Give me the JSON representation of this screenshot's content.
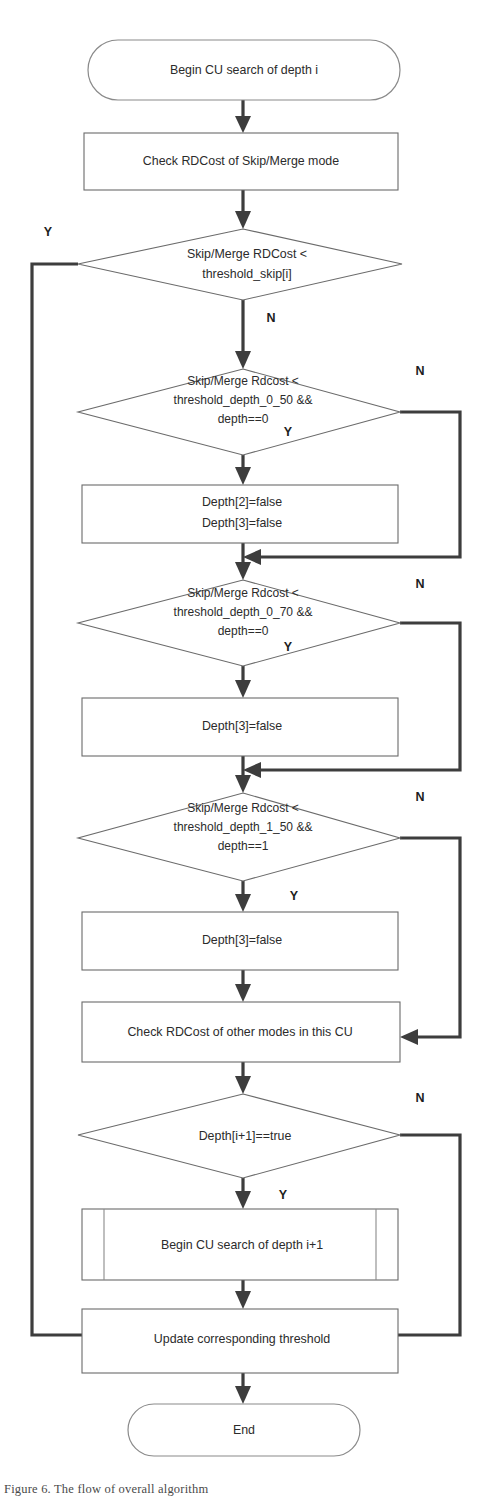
{
  "figure": {
    "caption": "Figure 6.   The flow of overall algorithm"
  },
  "colors": {
    "background": "#ffffff",
    "node_stroke": "#6b6b6b",
    "connector": "#3d3d3d",
    "text": "#2b2b2b"
  },
  "nodes": {
    "start": {
      "id": "start",
      "type": "terminator",
      "label": "Begin CU search of depth i"
    },
    "check_skip_merge": {
      "id": "check_skip_merge",
      "type": "process",
      "label": "Check RDCost of Skip/Merge mode"
    },
    "decision_skip": {
      "id": "decision_skip",
      "type": "decision",
      "line1": "Skip/Merge RDCost  <",
      "line2": "threshold_skip[i]",
      "yes_label": "Y",
      "no_label": "N"
    },
    "decision_d0_50": {
      "id": "decision_d0_50",
      "type": "decision",
      "line1": "Skip/Merge Rdcost <",
      "line2": "threshold_depth_0_50  &&",
      "line3": "depth==0",
      "yes_label": "Y",
      "no_label": "N"
    },
    "set_depth_23_false": {
      "id": "set_depth_23_false",
      "type": "process",
      "line1": "Depth[2]=false",
      "line2": "Depth[3]=false"
    },
    "decision_d0_70": {
      "id": "decision_d0_70",
      "type": "decision",
      "line1": "Skip/Merge Rdcost <",
      "line2": "threshold_depth_0_70  &&",
      "line3": "depth==0",
      "yes_label": "Y",
      "no_label": "N"
    },
    "set_depth3_false_a": {
      "id": "set_depth3_false_a",
      "type": "process",
      "label": "Depth[3]=false"
    },
    "decision_d1_50": {
      "id": "decision_d1_50",
      "type": "decision",
      "line1": "Skip/Merge Rdcost <",
      "line2": "threshold_depth_1_50  &&",
      "line3": "depth==1",
      "yes_label": "Y",
      "no_label": "N"
    },
    "set_depth3_false_b": {
      "id": "set_depth3_false_b",
      "type": "process",
      "label": "Depth[3]=false"
    },
    "check_other_modes": {
      "id": "check_other_modes",
      "type": "process",
      "label": "Check RDCost of other modes in this CU"
    },
    "decision_depth_next": {
      "id": "decision_depth_next",
      "type": "decision",
      "label": "Depth[i+1]==true",
      "yes_label": "Y",
      "no_label": "N"
    },
    "recurse": {
      "id": "recurse",
      "type": "subroutine",
      "label": "Begin  CU search of depth i+1"
    },
    "update_threshold": {
      "id": "update_threshold",
      "type": "process",
      "label": "Update corresponding threshold"
    },
    "end": {
      "id": "end",
      "type": "terminator",
      "label": "End"
    }
  },
  "branch_labels": {
    "skip_yes": "Y",
    "skip_no": "N",
    "d0_50_yes": "Y",
    "d0_50_no": "N",
    "d0_70_yes": "Y",
    "d0_70_no": "N",
    "d1_50_yes": "Y",
    "d1_50_no": "N",
    "depth_next_yes": "Y",
    "depth_next_no": "N"
  }
}
